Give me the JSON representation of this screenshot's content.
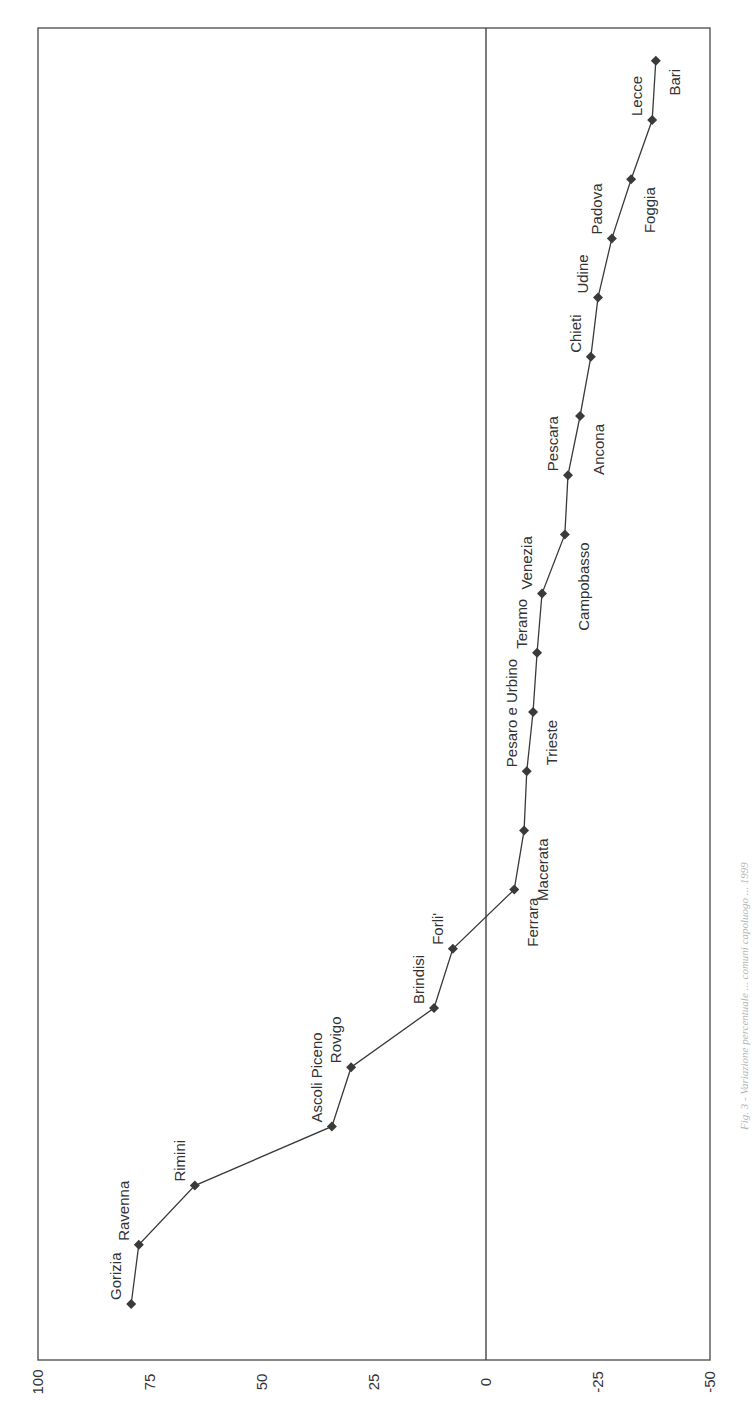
{
  "caption": "Fig. 3 - Variazione percentuale ... comuni capoluogo ... 1999",
  "chart_data": {
    "type": "line",
    "orientation": "rotated-90-ccw",
    "title": "",
    "xlabel": "",
    "ylabel": "",
    "ylim": [
      -50,
      100
    ],
    "yticks": [
      100,
      75,
      50,
      25,
      0,
      -25,
      -50
    ],
    "ytick_labels": [
      "100",
      "75",
      "50",
      "25",
      "0",
      "-25",
      "-50"
    ],
    "grid": false,
    "reference_line": 0,
    "marker": "diamond",
    "color": "#3a3a3a",
    "categories": [
      "Gorizia",
      "Ravenna",
      "Rimini",
      "Ascoli Piceno",
      "Rovigo",
      "Brindisi",
      "Forli'",
      "Ferrara",
      "Macerata",
      "Pesaro e Urbino",
      "Trieste",
      "Teramo",
      "Venezia",
      "Campobasso",
      "Pescara",
      "Ancona",
      "Chieti",
      "Udine",
      "Padova",
      "Foggia",
      "Lecce",
      "Bari"
    ],
    "values": [
      79.2,
      77.5,
      65.0,
      34.4,
      30.1,
      11.6,
      7.4,
      -6.3,
      -8.5,
      -9.1,
      -10.5,
      -11.4,
      -12.5,
      -17.6,
      -18.3,
      -21.0,
      -23.4,
      -25.0,
      -28.1,
      -32.4,
      -37.1,
      -37.9
    ],
    "label_side": [
      "above",
      "above",
      "above",
      "above",
      "above",
      "above",
      "above",
      "below",
      "below",
      "above",
      "below",
      "above",
      "above",
      "below",
      "above",
      "below",
      "above",
      "above",
      "above",
      "below",
      "above",
      "below"
    ]
  }
}
